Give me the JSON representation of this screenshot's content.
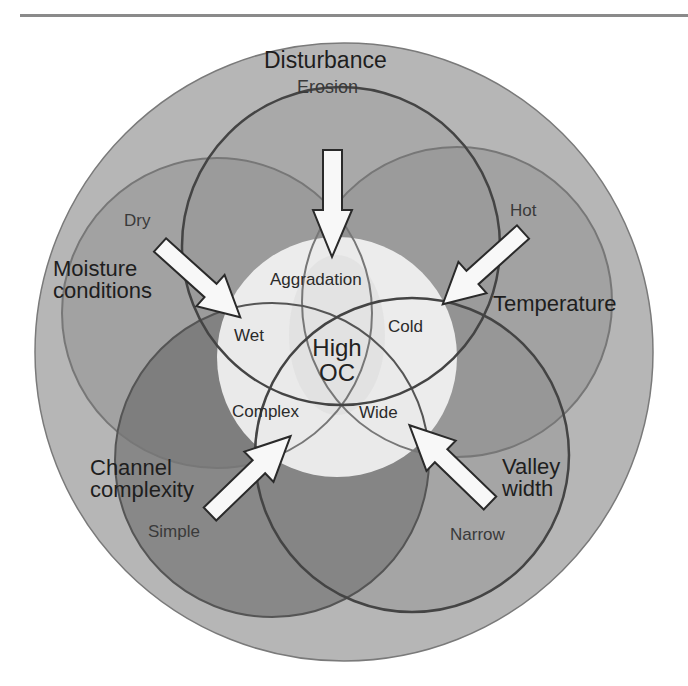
{
  "colors": {
    "outer_ring": "#b4b4b4",
    "circle_fill": "#6e6e6e",
    "center_fill": "#f2f2f2",
    "outline": "#444444",
    "arrow_fill": "#f7f7f7",
    "arrow_stroke": "#2a2a2a",
    "text": "#222222"
  },
  "center": {
    "line1": "High",
    "line2": "OC"
  },
  "factors": [
    {
      "id": "disturbance",
      "title": "Disturbance",
      "outer_state": "Erosion",
      "inner_state": "Aggradation"
    },
    {
      "id": "moisture",
      "title_line1": "Moisture",
      "title_line2": "conditions",
      "outer_state": "Dry",
      "inner_state": "Wet"
    },
    {
      "id": "temperature",
      "title": "Temperature",
      "outer_state": "Hot",
      "inner_state": "Cold"
    },
    {
      "id": "channel",
      "title_line1": "Channel",
      "title_line2": "complexity",
      "outer_state": "Simple",
      "inner_state": "Complex"
    },
    {
      "id": "valley",
      "title_line1": "Valley",
      "title_line2": "width",
      "outer_state": "Narrow",
      "inner_state": "Wide"
    }
  ]
}
